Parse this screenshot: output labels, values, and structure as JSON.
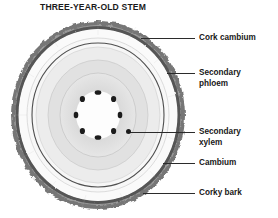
{
  "diagram": {
    "title": "THREE-YEAR-OLD STEM",
    "pith_vessel_count": 8,
    "growth_ring_count": 3
  },
  "labels": {
    "cork_cambium": "Cork cambium",
    "secondary_phloem": "Secondary\nphloem",
    "secondary_xylem": "Secondary\nxylem",
    "cambium": "Cambium",
    "corky_bark": "Corky bark"
  },
  "colors": {
    "background": "#ffffff",
    "text": "#171717",
    "leader_line": "#2b2b2b",
    "corky_bark": "#6e6e6e",
    "cork_cambium_ring": "#8a8a8a",
    "outer_pale": "#fbfbfb",
    "secondary_phloem": "#f2f2f2",
    "cambium_line": "#4a4a4a",
    "xylem_outer": "#e8e8e8",
    "xylem_mid": "#dcdcdc",
    "xylem_inner": "#d2d2d2",
    "pith": "#fdfdfd",
    "vessel": "#1c1c1c"
  }
}
